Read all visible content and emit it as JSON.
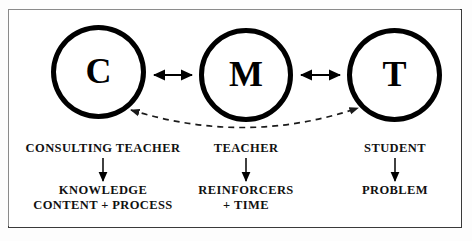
{
  "diagram": {
    "frame": {
      "border_color": "#3a3a3a",
      "background": "#ffffff"
    },
    "nodes": [
      {
        "id": "c",
        "letter": "C",
        "name": "consulting-teacher-node"
      },
      {
        "id": "m",
        "letter": "M",
        "name": "teacher-node"
      },
      {
        "id": "t",
        "letter": "T",
        "name": "student-node"
      }
    ],
    "connectors": [
      {
        "id": "c-m",
        "style": "solid",
        "heads": "double",
        "label": ""
      },
      {
        "id": "m-t",
        "style": "solid",
        "heads": "double",
        "label": ""
      },
      {
        "id": "c-t",
        "style": "dashed",
        "heads": "double",
        "label": ""
      }
    ],
    "columns": [
      {
        "id": "c",
        "role": "CONSULTING TEACHER",
        "outcome_lines": [
          "KNOWLEDGE",
          "CONTENT + PROCESS"
        ]
      },
      {
        "id": "m",
        "role": "TEACHER",
        "outcome_lines": [
          "REINFORCERS",
          "+ TIME"
        ]
      },
      {
        "id": "t",
        "role": "STUDENT",
        "outcome_lines": [
          "PROBLEM"
        ]
      }
    ],
    "colors": {
      "ink": "#000000",
      "text": "#111111",
      "frame": "#3a3a3a",
      "paper": "#ffffff"
    }
  }
}
